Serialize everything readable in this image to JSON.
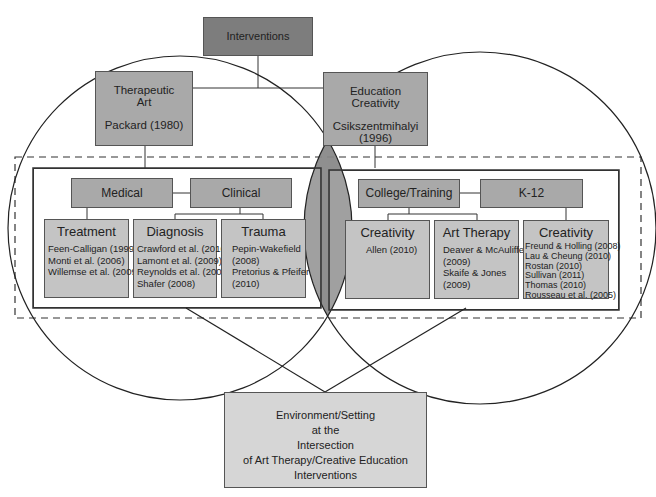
{
  "root": {
    "label": "Interventions"
  },
  "left_theme": {
    "title_line1": "Therapeutic",
    "title_line2": "Art",
    "citation": "Packard (1980)"
  },
  "right_theme": {
    "title_line1": "Education",
    "title_line2": "Creativity",
    "citation": "Csikszentmihalyi (1996)"
  },
  "left_group": {
    "categories": [
      "Medical",
      "Clinical"
    ],
    "boxes": [
      {
        "title": "Treatment",
        "refs": [
          "Feen-Calligan (1999)",
          "Monti et al. (2006)",
          "Willemse et al. (2009)"
        ]
      },
      {
        "title": "Diagnosis",
        "refs": [
          "Crawford et al. (2010)",
          "Lamont et al. (2009)",
          "Reynolds et al. (2008)",
          "Shafer (2008)"
        ]
      },
      {
        "title": "Trauma",
        "refs": [
          "Pepin-Wakefield",
          "(2008)",
          "Pretorius & Pfeifer",
          "(2010)"
        ]
      }
    ]
  },
  "right_group": {
    "categories": [
      "College/Training",
      "K-12"
    ],
    "boxes": [
      {
        "title": "Creativity",
        "refs": [
          "Allen (2010)"
        ]
      },
      {
        "title": "Art Therapy",
        "refs": [
          "Deaver & McAuliffe",
          "(2009)",
          "Skaife & Jones",
          "(2009)"
        ]
      },
      {
        "title": "Creativity",
        "refs": [
          "Freund & Holling (2008)",
          "Lau & Cheung (2010)",
          "Rostan (2010)",
          "Sullivan (2011)",
          "Thomas (2010)",
          "Rousseau et al. (2005)"
        ]
      }
    ]
  },
  "outcome": {
    "lines": [
      "Environment/Setting",
      "at the",
      "Intersection",
      "of Art Therapy/Creative Education",
      "Interventions"
    ]
  },
  "colors": {
    "dark": "#7d7d7d",
    "mid": "#a9a9a9",
    "light": "#c4c4c4",
    "intersection": "#8f8f8f"
  }
}
